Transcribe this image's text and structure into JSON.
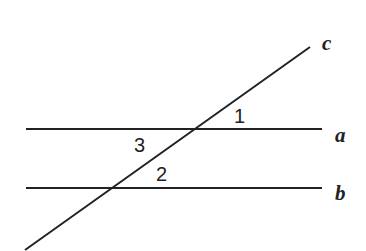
{
  "diagram": {
    "lines": [
      {
        "name": "a",
        "label": "a"
      },
      {
        "name": "b",
        "label": "b"
      },
      {
        "name": "c",
        "label": "c"
      }
    ],
    "angles": [
      {
        "label": "1"
      },
      {
        "label": "2"
      },
      {
        "label": "3"
      }
    ]
  }
}
